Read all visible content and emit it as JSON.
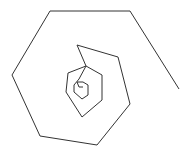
{
  "diagram": {
    "type": "hexagonal-spiral",
    "stroke_color": "#333333",
    "background": "#ffffff",
    "stroke_width": 1,
    "points": "83,87 79,87 77,82 83,82 88,85 88,95 82,99 74,92 74,85 79,79 86,66 102,75 102,100 82,117 66,92 68,73 86,66 77,45 118,57 130,104 97,145 40,136 12,75 50,11 130,11 179,89"
  }
}
